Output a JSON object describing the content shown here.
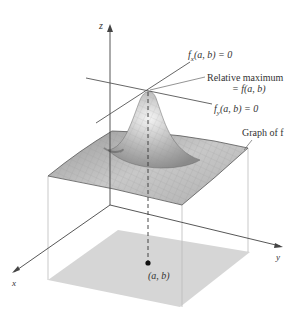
{
  "figure": {
    "axes": {
      "z_label": "z",
      "x_label": "x",
      "y_label": "y"
    },
    "annotations": {
      "fx": "f",
      "fx_sub": "x",
      "fx_rest": "(a, b) = 0",
      "rel_max_line1": "Relative maximum",
      "rel_max_line2": "= f(a, b)",
      "fy": "f",
      "fy_sub": "y",
      "fy_rest": "(a, b) = 0",
      "graph_label": "Graph of f",
      "point_label": "(a, b)"
    },
    "colors": {
      "floor": "#d4d4d4",
      "surface_light": "#e6e6e6",
      "surface_dark": "#7a7a7a",
      "lines": "#444444"
    }
  }
}
